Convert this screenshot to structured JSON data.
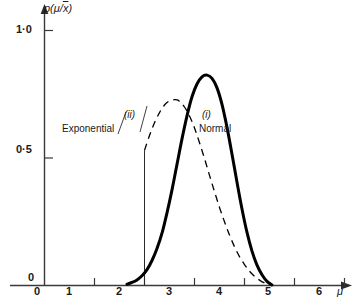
{
  "chart_data": {
    "type": "line",
    "title": "",
    "xlabel": "μ",
    "ylabel": "p(μ/x̄)",
    "xlim": [
      0,
      6.6
    ],
    "ylim": [
      0,
      1.12
    ],
    "grid": false,
    "legend_position": "inline-annotations",
    "x_ticks": [
      "0",
      "1",
      "2",
      "3",
      "4",
      "5",
      "6"
    ],
    "x_tick_values": [
      0,
      1,
      2,
      3,
      4,
      5,
      6
    ],
    "y_ticks": [
      "0",
      "0·5",
      "1·0"
    ],
    "y_tick_values": [
      0,
      0.5,
      1.0
    ],
    "series": [
      {
        "name": "Normal",
        "roman": "(i)",
        "style": "solid",
        "linewidth": 3,
        "color": "#000000",
        "x": [
          1.65,
          1.75,
          1.85,
          1.95,
          2.05,
          2.15,
          2.25,
          2.35,
          2.45,
          2.55,
          2.65,
          2.75,
          2.85,
          2.95,
          3.05,
          3.15,
          3.25,
          3.35,
          3.45,
          3.55,
          3.65,
          3.75,
          3.85,
          3.95,
          4.05,
          4.15,
          4.25,
          4.35,
          4.45,
          4.55
        ],
        "y": [
          0.005,
          0.012,
          0.022,
          0.038,
          0.062,
          0.098,
          0.145,
          0.205,
          0.285,
          0.375,
          0.475,
          0.575,
          0.665,
          0.74,
          0.79,
          0.818,
          0.825,
          0.812,
          0.775,
          0.71,
          0.62,
          0.515,
          0.405,
          0.3,
          0.208,
          0.135,
          0.08,
          0.042,
          0.016,
          0.002
        ]
      },
      {
        "name": "Exponential",
        "roman": "(ii)",
        "style": "dashed",
        "linewidth": 1.3,
        "color": "#000000",
        "truncated_at": 2.0,
        "x": [
          2.0,
          2.1,
          2.2,
          2.3,
          2.4,
          2.5,
          2.6,
          2.65,
          2.7,
          2.8,
          2.9,
          3.0,
          3.1,
          3.2,
          3.3,
          3.4,
          3.5,
          3.6,
          3.7,
          3.8,
          3.9,
          4.0,
          4.1,
          4.2,
          4.3,
          4.4,
          4.5
        ],
        "y": [
          0.53,
          0.588,
          0.638,
          0.678,
          0.708,
          0.724,
          0.729,
          0.728,
          0.722,
          0.7,
          0.665,
          0.618,
          0.56,
          0.498,
          0.432,
          0.368,
          0.306,
          0.25,
          0.198,
          0.152,
          0.113,
          0.082,
          0.056,
          0.036,
          0.021,
          0.01,
          0.002
        ]
      }
    ],
    "annotations": [
      {
        "text": "(ii)",
        "series": "Exponential",
        "kind": "roman-numeral"
      },
      {
        "text": "Exponential",
        "series": "Exponential",
        "kind": "name"
      },
      {
        "text": "(i)",
        "series": "Normal",
        "kind": "roman-numeral"
      },
      {
        "text": "Normal",
        "series": "Normal",
        "kind": "name"
      }
    ]
  },
  "axes": {
    "y_label_prefix": "p(μ/",
    "y_label_overline": "x",
    "y_label_suffix": ")",
    "x_label": "μ",
    "y_ticks": {
      "one": "1·0",
      "half": "0·5",
      "zero": "0"
    },
    "x_ticks": {
      "zero": "0",
      "one": "1",
      "two": "2",
      "three": "3",
      "four": "4",
      "five": "5",
      "six": "6"
    }
  },
  "labels": {
    "exponential_roman": "(ii)",
    "exponential_name": "Exponential",
    "normal_roman": "(i)",
    "normal_name": "Normal"
  },
  "colors": {
    "ink": "#000000",
    "axis": "#3a3a3a",
    "background": "#ffffff"
  }
}
